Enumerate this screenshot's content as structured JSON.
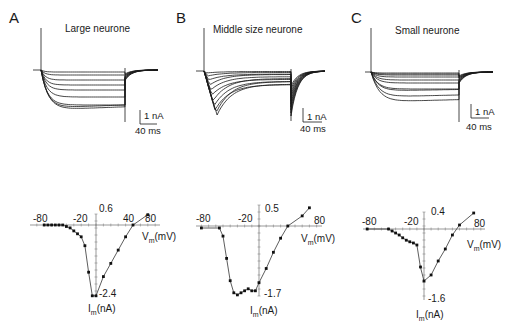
{
  "panels": [
    {
      "letter": "A",
      "title": "Large neurone",
      "scale_current": "1 nA",
      "scale_time": "40 ms",
      "iv": {
        "x_ticks": [
          "-80",
          "-20",
          "40",
          "80"
        ],
        "y_top": "0.6",
        "y_bottom": "-2.4",
        "xlabel_main": "V",
        "xlabel_sub": "m",
        "xlabel_unit": "(mV)",
        "ylabel_main": "I",
        "ylabel_sub": "m",
        "ylabel_unit": "(nA)"
      }
    },
    {
      "letter": "B",
      "title": "Middle size neurone",
      "scale_current": "1 nA",
      "scale_time": "40 ms",
      "iv": {
        "x_ticks": [
          "-80",
          "-20",
          "80"
        ],
        "y_top": "0.5",
        "y_bottom": "-1.7",
        "xlabel_main": "V",
        "xlabel_sub": "m",
        "xlabel_unit": "(mV)",
        "ylabel_main": "I",
        "ylabel_sub": "m",
        "ylabel_unit": "(nA)"
      }
    },
    {
      "letter": "C",
      "title": "Small neurone",
      "scale_current": "1 nA",
      "scale_time": "40 ms",
      "iv": {
        "x_ticks": [
          "-80",
          "-20",
          "80"
        ],
        "y_top": "0.4",
        "y_bottom": "-1.6",
        "xlabel_main": "V",
        "xlabel_sub": "m",
        "xlabel_unit": "(mV)",
        "ylabel_main": "I",
        "ylabel_sub": "m",
        "ylabel_unit": "(nA)"
      }
    }
  ],
  "chart_data": [
    {
      "type": "line",
      "title": "A  Large neurone — current-voltage relation",
      "xlabel": "Vm (mV)",
      "ylabel": "Im (nA)",
      "xlim": [
        -80,
        80
      ],
      "ylim": [
        -2.4,
        0.6
      ],
      "grid": false,
      "series": [
        {
          "name": "Im",
          "x": [
            -70,
            -65,
            -60,
            -55,
            -50,
            -45,
            -40,
            -35,
            -30,
            -25,
            -20,
            -15,
            -10,
            -5,
            0,
            10,
            20,
            30,
            40,
            50,
            70
          ],
          "y": [
            0.0,
            0.0,
            0.0,
            0.0,
            0.0,
            0.0,
            -0.05,
            -0.1,
            -0.2,
            -0.3,
            -0.4,
            -0.7,
            -1.6,
            -2.4,
            -2.4,
            -1.75,
            -1.3,
            -0.85,
            -0.4,
            0.0,
            0.35
          ]
        }
      ]
    },
    {
      "type": "line",
      "title": "B  Middle size neurone — current-voltage relation",
      "xlabel": "Vm (mV)",
      "ylabel": "Im (nA)",
      "xlim": [
        -80,
        80
      ],
      "ylim": [
        -1.7,
        0.5
      ],
      "grid": false,
      "series": [
        {
          "name": "Im",
          "x": [
            -80,
            -55,
            -50,
            -45,
            -40,
            -35,
            -30,
            -25,
            -20,
            -15,
            -10,
            -5,
            0,
            10,
            20,
            30,
            40,
            60,
            70
          ],
          "y": [
            -0.05,
            -0.05,
            -0.25,
            -0.8,
            -1.35,
            -1.65,
            -1.7,
            -1.65,
            -1.6,
            -1.55,
            -1.6,
            -1.6,
            -1.4,
            -1.05,
            -0.65,
            -0.3,
            0.0,
            0.25,
            0.45
          ]
        }
      ]
    },
    {
      "type": "line",
      "title": "C  Small neurone — current-voltage relation",
      "xlabel": "Vm (mV)",
      "ylabel": "Im (nA)",
      "xlim": [
        -80,
        80
      ],
      "ylim": [
        -1.6,
        0.4
      ],
      "grid": false,
      "series": [
        {
          "name": "Im",
          "x": [
            -80,
            -50,
            -45,
            -40,
            -35,
            -30,
            -25,
            -20,
            -15,
            -10,
            -5,
            0,
            10,
            20,
            30,
            40,
            50,
            70
          ],
          "y": [
            0.0,
            0.0,
            -0.05,
            -0.1,
            -0.15,
            -0.22,
            -0.28,
            -0.32,
            -0.35,
            -0.4,
            -0.95,
            -1.3,
            -1.15,
            -0.8,
            -0.5,
            -0.15,
            0.1,
            0.4
          ]
        }
      ]
    }
  ]
}
